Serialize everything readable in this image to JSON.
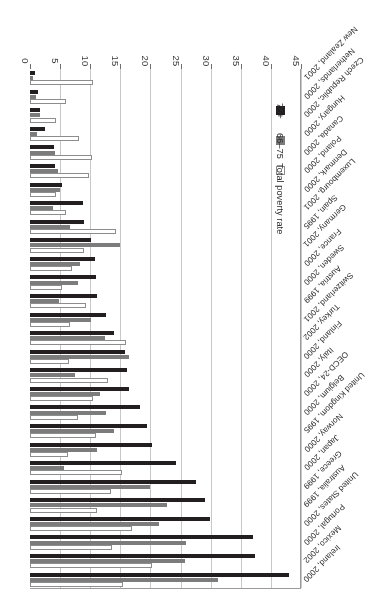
{
  "chart_data": {
    "type": "bar",
    "orientation": "horizontal",
    "title": "",
    "xlabel": "percent of age group in total",
    "ylabel": "",
    "xlim": [
      0,
      45
    ],
    "xticks": [
      0,
      5,
      10,
      15,
      20,
      25,
      30,
      35,
      40,
      45
    ],
    "grid": true,
    "legend_position": "bottom-left",
    "categories": [
      "Ireland, 2000",
      "Mexico, 2002",
      "Portugal, 2000",
      "United States, 2000",
      "Australia, 1999",
      "Greece, 1999",
      "Japan, 2000",
      "Norway, 2000",
      "United Kingdom, 1995",
      "Belgium, 2000",
      "OECD-24, 2000",
      "Italy, 2000",
      "Finland, 2000",
      "Turkey, 2002",
      "Switzerland, 2001",
      "Austria, 1999",
      "Sweden, 2000",
      "France, 2000",
      "Germany, 2001",
      "Spain, 1995",
      "Luxembourg, 2001",
      "Denmark, 2000",
      "Poland, 2000",
      "Canada, 2000",
      "Hungary, 2000",
      "Czech Republic, 2000",
      "Netherlands, 2000",
      "New Zealand, 2001"
    ],
    "series": [
      {
        "name": "Total poverty rate",
        "key": "total",
        "color": "#ffffff",
        "values": [
          15.4,
          20.3,
          13.7,
          17.0,
          11.2,
          13.5,
          15.3,
          6.3,
          10.9,
          8.0,
          10.4,
          12.9,
          6.4,
          15.9,
          6.7,
          9.3,
          5.3,
          7.0,
          8.9,
          14.3,
          6.0,
          4.3,
          9.8,
          10.3,
          8.1,
          4.4,
          6.0,
          10.4
        ]
      },
      {
        "name": "66–75",
        "key": "mid",
        "color": "#7c7c7c",
        "values": [
          31.3,
          25.8,
          25.9,
          21.5,
          22.8,
          19.9,
          5.6,
          11.2,
          14.0,
          12.6,
          11.6,
          7.4,
          16.5,
          12.5,
          10.2,
          4.9,
          8.0,
          8.3,
          14.9,
          6.7,
          3.9,
          5.0,
          4.6,
          4.1,
          1.1,
          1.6,
          1.0,
          0.5
        ]
      },
      {
        "name": "76+",
        "key": "old",
        "color": "#231f20",
        "values": [
          43.0,
          37.3,
          37.0,
          29.9,
          29.0,
          27.6,
          24.2,
          20.2,
          19.4,
          18.3,
          16.4,
          16.1,
          15.8,
          14.0,
          12.7,
          11.2,
          11.0,
          10.8,
          10.2,
          9.0,
          8.8,
          5.3,
          4.1,
          4.0,
          2.5,
          1.7,
          1.4,
          0.8
        ]
      }
    ]
  },
  "legend": {
    "items": [
      {
        "label": "Total poverty rate",
        "key": "total"
      },
      {
        "label": "66–75",
        "key": "mid"
      },
      {
        "label": "76+",
        "key": "old"
      }
    ]
  },
  "axis": {
    "title": "percent of age group in total"
  }
}
